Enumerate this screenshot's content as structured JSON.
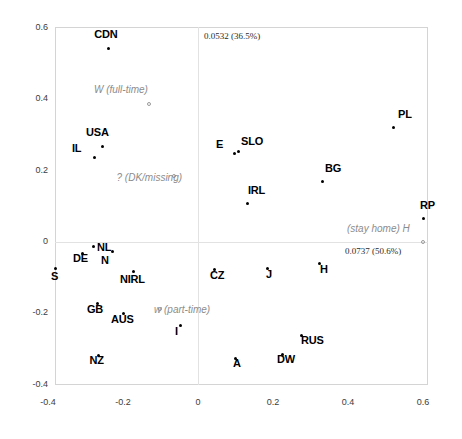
{
  "chart_data": {
    "type": "scatter",
    "title": "",
    "xlabel": "",
    "ylabel": "",
    "xlim": [
      -0.45,
      0.61
    ],
    "ylim": [
      -0.44,
      0.61
    ],
    "grid": false,
    "legend": "none",
    "xticks": [
      "-0.4",
      "-0.2",
      "0",
      "0.2",
      "0.4",
      "0.6"
    ],
    "xtickvalues": [
      -0.4,
      -0.2,
      0,
      0.2,
      0.4,
      0.6
    ],
    "yticks": [
      "0.6",
      "0.4",
      "0.2",
      "0",
      "-0.2",
      "-0.4"
    ],
    "ytickvalues": [
      0.6,
      0.4,
      0.2,
      0,
      -0.2,
      -0.4
    ],
    "annotations": {
      "dim2_inertia": "0.0532 (36.5%)",
      "dim1_inertia": "0.0737 (50.6%)"
    },
    "active_points": [
      {
        "label": "CDN",
        "x": -0.2395,
        "y": 0.542,
        "label_dx": -14,
        "label_dy": -15
      },
      {
        "label": "USA",
        "x": -0.256,
        "y": 0.2666,
        "label_dx": -16,
        "label_dy": -15
      },
      {
        "label": "IL",
        "x": -0.2773,
        "y": 0.2357,
        "label_dx": -22,
        "label_dy": -10
      },
      {
        "label": "E",
        "x": 0.096,
        "y": 0.247,
        "label_dx": -18,
        "label_dy": -10
      },
      {
        "label": "SLO",
        "x": 0.1067,
        "y": 0.2526,
        "label_dx": 3,
        "label_dy": -11
      },
      {
        "label": "PL",
        "x": 0.52,
        "y": 0.3198,
        "label_dx": 5,
        "label_dy": -14
      },
      {
        "label": "BG",
        "x": 0.3333,
        "y": 0.1684,
        "label_dx": 2,
        "label_dy": -14
      },
      {
        "label": "IRL",
        "x": 0.1307,
        "y": 0.1067,
        "label_dx": 1,
        "label_dy": -14
      },
      {
        "label": "RP",
        "x": 0.6,
        "y": 0.0645,
        "label_dx": -3,
        "label_dy": -14
      },
      {
        "label": "NL",
        "x": -0.28,
        "y": -0.014,
        "label_dx": 4,
        "label_dy": 0
      },
      {
        "label": "DE",
        "x": -0.3093,
        "y": -0.0309,
        "label_dx": -9,
        "label_dy": 5
      },
      {
        "label": "S",
        "x": -0.3813,
        "y": -0.073,
        "label_dx": -4,
        "label_dy": 8
      },
      {
        "label": "N",
        "x": -0.2293,
        "y": -0.0253,
        "label_dx": -11,
        "label_dy": 9
      },
      {
        "label": "NIRL",
        "x": -0.1733,
        "y": -0.0814,
        "label_dx": -13,
        "label_dy": 8
      },
      {
        "label": "GB",
        "x": -0.2667,
        "y": -0.1712,
        "label_dx": -11,
        "label_dy": 6
      },
      {
        "label": "AUS",
        "x": -0.2,
        "y": -0.1993,
        "label_dx": -12,
        "label_dy": 6
      },
      {
        "label": "I",
        "x": -0.048,
        "y": -0.233,
        "label_dx": -5,
        "label_dy": 6
      },
      {
        "label": "NZ",
        "x": -0.2653,
        "y": -0.3174,
        "label_dx": -9,
        "label_dy": 5
      },
      {
        "label": "CZ",
        "x": 0.0427,
        "y": -0.0758,
        "label_dx": -4,
        "label_dy": 6
      },
      {
        "label": "J",
        "x": 0.184,
        "y": -0.073,
        "label_dx": -1,
        "label_dy": 6
      },
      {
        "label": "H",
        "x": 0.3227,
        "y": -0.0589,
        "label_dx": 1,
        "label_dy": 6
      },
      {
        "label": "RUS",
        "x": 0.2747,
        "y": -0.261,
        "label_dx": 0,
        "label_dy": 5
      },
      {
        "label": "DW",
        "x": 0.224,
        "y": -0.3146,
        "label_dx": -5,
        "label_dy": 5
      },
      {
        "label": "A",
        "x": 0.0987,
        "y": -0.3258,
        "label_dx": -2,
        "label_dy": 5
      }
    ],
    "supplementary_points": [
      {
        "label": "W (full-time)",
        "x": -0.1307,
        "y": 0.3876,
        "label_dx": -55,
        "label_dy": -14
      },
      {
        "label": "? (DK/missing)",
        "x": -0.0627,
        "y": 0.1852,
        "label_dx": -58,
        "label_dy": 2
      },
      {
        "label": "w (part-time)",
        "x": -0.1013,
        "y": -0.1881,
        "label_dx": -6,
        "label_dy": 1
      },
      {
        "label": "(stay home) H",
        "x": 0.6,
        "y": -0.0014,
        "label_dx": -76,
        "label_dy": -13
      }
    ]
  }
}
